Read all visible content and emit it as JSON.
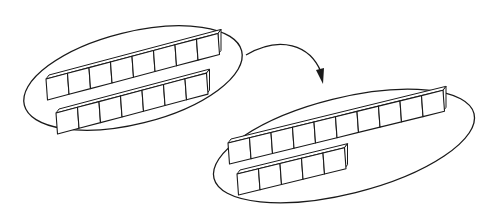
{
  "diagram": {
    "type": "regrouping of unit cubes",
    "stroke_color": "#1a1a1a",
    "background": "#ffffff",
    "groups": [
      {
        "name": "before",
        "rows": [
          {
            "cubes": 8
          },
          {
            "cubes": 7
          }
        ],
        "total": 15
      },
      {
        "name": "after",
        "rows": [
          {
            "cubes": 10
          },
          {
            "cubes": 5
          }
        ],
        "total": 15
      }
    ],
    "arrow": {
      "from": "before",
      "to": "after",
      "icon": "curved-arrow-icon"
    }
  }
}
